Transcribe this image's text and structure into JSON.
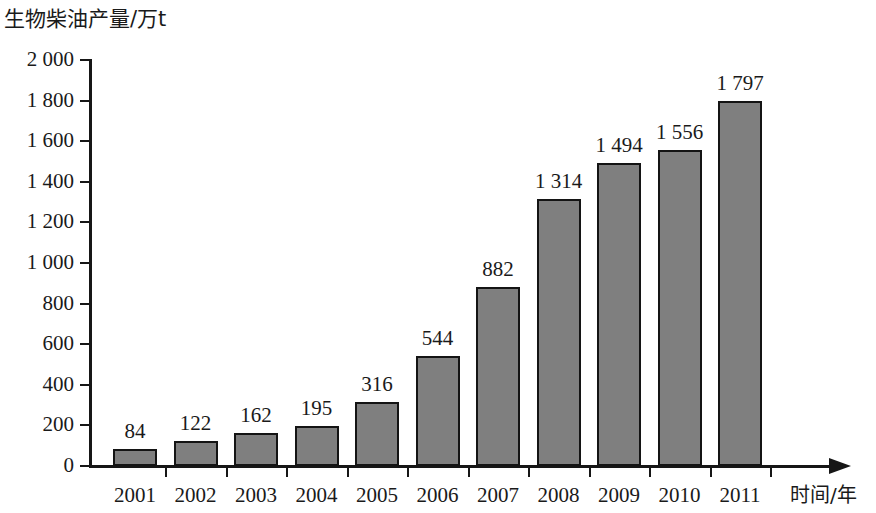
{
  "chart_data": {
    "type": "bar",
    "title": "生物柴油产量/万t",
    "ylabel": "生物柴油产量/万t",
    "xlabel": "时间/年",
    "categories": [
      "2001",
      "2002",
      "2003",
      "2004",
      "2005",
      "2006",
      "2007",
      "2008",
      "2009",
      "2010",
      "2011"
    ],
    "values": [
      84,
      122,
      162,
      195,
      316,
      544,
      882,
      1314,
      1494,
      1556,
      1797
    ],
    "value_labels": [
      "84",
      "122",
      "162",
      "195",
      "316",
      "544",
      "882",
      "1 314",
      "1 494",
      "1 556",
      "1 797"
    ],
    "ylim": [
      0,
      2000
    ],
    "ytick_values": [
      0,
      200,
      400,
      600,
      800,
      1000,
      1200,
      1400,
      1600,
      1800,
      2000
    ],
    "ytick_labels": [
      "0",
      "200",
      "400",
      "600",
      "800",
      "1 000",
      "1 200",
      "1 400",
      "1 600",
      "1 800",
      "2 000"
    ],
    "grid": false,
    "legend": "none",
    "bar_color": "#7f7f7f",
    "bar_edge_color": "#141414",
    "axis_color": "#161616"
  }
}
